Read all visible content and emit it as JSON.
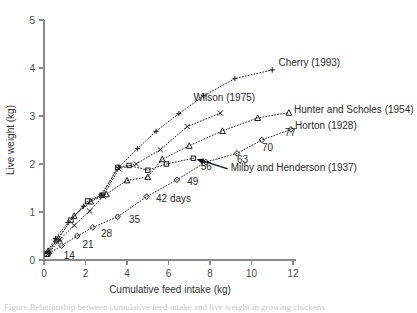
{
  "figure": {
    "background_color": "#ffffff",
    "axis_color": "#8a8a8a",
    "ink_color": "#2b2b2b",
    "caption_partial": "Figure  Relationship between cumulative feed intake and live weight in growing chickens"
  },
  "chart_data": {
    "type": "line",
    "title": "",
    "xlabel": "Cumulative feed intake (kg)",
    "ylabel": "Live weight (kg)",
    "xlim": [
      0,
      12
    ],
    "ylim": [
      0,
      5
    ],
    "xticks": [
      0,
      2,
      4,
      6,
      8,
      10,
      12
    ],
    "yticks": [
      0,
      1,
      2,
      3,
      4,
      5
    ],
    "xtick_labels": [
      "0",
      "2",
      "4",
      "6",
      "8",
      "10",
      "12"
    ],
    "ytick_labels": [
      "0",
      "1",
      "2",
      "3",
      "4",
      "5"
    ],
    "grid": false,
    "legend_position": "inline-right-of-curves",
    "series": [
      {
        "name": "Cherry (1993)",
        "marker": "plus",
        "linestyle": "dotted",
        "x": [
          0.15,
          0.55,
          1.15,
          1.9,
          2.75,
          3.6,
          4.5,
          5.4,
          6.5,
          7.7,
          9.2,
          11.0
        ],
        "y": [
          0.16,
          0.45,
          0.78,
          1.12,
          1.36,
          1.93,
          2.32,
          2.68,
          3.05,
          3.42,
          3.78,
          3.96
        ]
      },
      {
        "name": "Wilson (1975)",
        "marker": "cross",
        "linestyle": "dotted",
        "x": [
          0.2,
          0.75,
          1.45,
          2.2,
          2.85,
          3.6,
          4.45,
          5.6,
          6.9,
          8.5
        ],
        "y": [
          0.13,
          0.42,
          0.72,
          1.02,
          1.33,
          1.9,
          2.0,
          2.3,
          2.78,
          3.06
        ]
      },
      {
        "name": "Hunter and Scholes (1954)",
        "marker": "triangle",
        "linestyle": "dotted",
        "x": [
          0.2,
          0.7,
          1.45,
          2.25,
          3.0,
          4.0,
          5.0,
          5.7,
          7.0,
          8.6,
          10.3,
          11.8
        ],
        "y": [
          0.19,
          0.45,
          0.92,
          1.22,
          1.37,
          1.66,
          1.73,
          2.1,
          2.38,
          2.69,
          2.96,
          3.07
        ]
      },
      {
        "name": "Horton (1928)",
        "marker": "diamond",
        "linestyle": "dotted",
        "x": [
          0.25,
          0.85,
          1.6,
          2.35,
          3.55,
          4.95,
          6.4,
          7.8,
          9.3,
          10.5,
          11.9
        ],
        "y": [
          0.14,
          0.3,
          0.5,
          0.68,
          0.9,
          1.32,
          1.67,
          2.04,
          2.22,
          2.5,
          2.72
        ]
      },
      {
        "name": "Milby and Henderson (1937)",
        "marker": "square",
        "linestyle": "dotted",
        "x": [
          0.15,
          0.6,
          1.3,
          2.1,
          2.8,
          3.55,
          4.1,
          5.0,
          5.9,
          7.2
        ],
        "y": [
          0.12,
          0.4,
          0.83,
          1.23,
          1.35,
          1.93,
          1.97,
          1.87,
          2.0,
          2.12
        ]
      }
    ],
    "annotations": [
      {
        "text": "Cherry (1993)",
        "kind": "series-label",
        "x": 11.3,
        "y": 4.05
      },
      {
        "text": "Wilson (1975)",
        "kind": "series-label",
        "x": 7.2,
        "y": 3.32
      },
      {
        "text": "Hunter and Scholes (1954)",
        "kind": "series-label",
        "x": 12.05,
        "y": 3.07
      },
      {
        "text": "Horton (1928)",
        "kind": "series-label",
        "x": 12.1,
        "y": 2.73
      },
      {
        "text": "Milby and Henderson (1937)",
        "kind": "series-label",
        "x": 9.0,
        "y": 1.86
      },
      {
        "text": "14",
        "kind": "day-label",
        "x": 0.95,
        "y": 0.02
      },
      {
        "text": "21",
        "kind": "day-label",
        "x": 1.85,
        "y": 0.26
      },
      {
        "text": "28",
        "kind": "day-label",
        "x": 2.75,
        "y": 0.48
      },
      {
        "text": "35",
        "kind": "day-label",
        "x": 4.1,
        "y": 0.78
      },
      {
        "text": "42 days",
        "kind": "day-label",
        "x": 5.4,
        "y": 1.2
      },
      {
        "text": "49",
        "kind": "day-label",
        "x": 6.9,
        "y": 1.56
      },
      {
        "text": "56",
        "kind": "day-label",
        "x": 7.55,
        "y": 1.87
      },
      {
        "text": "63",
        "kind": "day-label",
        "x": 9.3,
        "y": 2.03
      },
      {
        "text": "70",
        "kind": "day-label",
        "x": 10.5,
        "y": 2.28
      },
      {
        "text": "77",
        "kind": "day-label",
        "x": 11.6,
        "y": 2.58
      }
    ],
    "callout": {
      "label": "Milby and Henderson (1937)",
      "arrow_from_x": 8.85,
      "arrow_from_y": 1.9,
      "arrow_to_x": 7.35,
      "arrow_to_y": 2.1
    }
  }
}
